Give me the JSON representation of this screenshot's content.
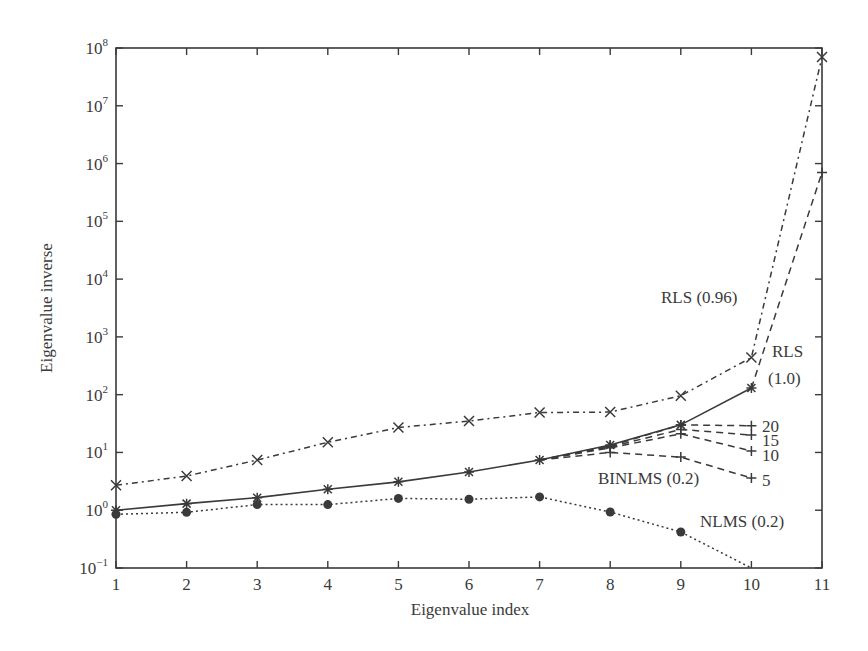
{
  "chart_data": {
    "type": "line",
    "title": "",
    "xlabel": "Eigenvalue index",
    "ylabel": "Eigenvalue inverse",
    "yscale": "log",
    "xlim": [
      1,
      11
    ],
    "ylim": [
      0.1,
      100000000
    ],
    "grid": false,
    "legend": "none (inline annotations)",
    "x_ticks": [
      "1",
      "2",
      "3",
      "4",
      "5",
      "6",
      "7",
      "8",
      "9",
      "10",
      "11"
    ],
    "y_ticks": [
      {
        "base": "10",
        "exp": "8",
        "value": 100000000
      },
      {
        "base": "10",
        "exp": "7",
        "value": 10000000
      },
      {
        "base": "10",
        "exp": "6",
        "value": 1000000
      },
      {
        "base": "10",
        "exp": "5",
        "value": 100000
      },
      {
        "base": "10",
        "exp": "4",
        "value": 10000
      },
      {
        "base": "10",
        "exp": "3",
        "value": 1000
      },
      {
        "base": "10",
        "exp": "2",
        "value": 100
      },
      {
        "base": "10",
        "exp": "1",
        "value": 10
      },
      {
        "base": "10",
        "exp": "0",
        "value": 1
      },
      {
        "base": "10",
        "exp": "−1",
        "value": 0.1
      }
    ],
    "series": [
      {
        "name": "RLS (0.96)",
        "marker": "x",
        "line": "dashdot",
        "x": [
          1,
          2,
          3,
          4,
          5,
          6,
          7,
          8,
          9,
          10,
          11
        ],
        "values": [
          2.7,
          3.9,
          7.4,
          15,
          27,
          35,
          49,
          50,
          96,
          440,
          70000000
        ]
      },
      {
        "name": "RLS (1.0)",
        "marker": "asterisk",
        "line": "solid",
        "x": [
          1,
          2,
          3,
          4,
          5,
          6,
          7,
          8,
          9,
          10
        ],
        "values": [
          1.0,
          1.3,
          1.65,
          2.3,
          3.1,
          4.6,
          7.4,
          13.5,
          30,
          130
        ]
      },
      {
        "name": "RLS (1.0) extension",
        "marker": "plus",
        "line": "dashed",
        "x": [
          10,
          11
        ],
        "values": [
          130,
          700000
        ]
      },
      {
        "name": "BINLMS (0.2) 20",
        "marker": "plus",
        "line": "dashed",
        "x": [
          7,
          8,
          9,
          10
        ],
        "values": [
          7.4,
          13,
          30,
          29
        ]
      },
      {
        "name": "BINLMS (0.2) 15",
        "marker": "plus",
        "line": "dashed",
        "x": [
          7,
          8,
          9,
          10
        ],
        "values": [
          7.4,
          12.5,
          25,
          20
        ]
      },
      {
        "name": "BINLMS (0.2) 10",
        "marker": "plus",
        "line": "dashed",
        "x": [
          7,
          8,
          9,
          10
        ],
        "values": [
          7.4,
          12,
          21,
          10.6
        ]
      },
      {
        "name": "BINLMS (0.2) 5",
        "marker": "plus",
        "line": "dashed",
        "x": [
          7,
          8,
          9,
          10
        ],
        "values": [
          7.4,
          10,
          8.3,
          3.6
        ]
      },
      {
        "name": "NLMS (0.2)",
        "marker": "dot",
        "line": "dotted",
        "x": [
          1,
          2,
          3,
          4,
          5,
          6,
          7,
          8,
          9,
          10
        ],
        "values": [
          0.85,
          0.92,
          1.25,
          1.25,
          1.6,
          1.55,
          1.7,
          0.93,
          0.42,
          0.1
        ]
      }
    ],
    "annotations": [
      {
        "text": "RLS (0.96)",
        "x": 661,
        "y": 303
      },
      {
        "text": "RLS",
        "x": 772,
        "y": 357
      },
      {
        "text": "(1.0)",
        "x": 768,
        "y": 384
      },
      {
        "text": "20",
        "x": 762,
        "y": 432
      },
      {
        "text": "15",
        "x": 762,
        "y": 446
      },
      {
        "text": "10",
        "x": 762,
        "y": 461
      },
      {
        "text": "5",
        "x": 762,
        "y": 486
      },
      {
        "text": "BINLMS (0.2)",
        "x": 598,
        "y": 484
      },
      {
        "text": "NLMS (0.2)",
        "x": 700,
        "y": 527
      }
    ]
  }
}
